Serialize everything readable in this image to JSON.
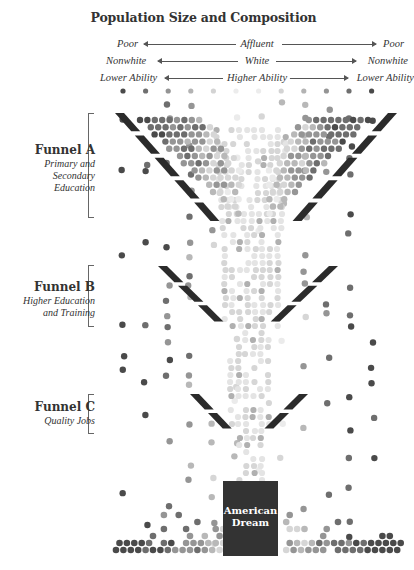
{
  "title": "Population Size and Composition",
  "axes": [
    {
      "left": "Poor",
      "center": "Affluent",
      "right": "Poor"
    },
    {
      "left": "Nonwhite",
      "center": "White",
      "right": "Nonwhite"
    },
    {
      "left": "Lower Ability",
      "center": "Higher Ability",
      "right": "Lower Ability"
    }
  ],
  "funnels": [
    {
      "name": "Funnel A",
      "description_line1": "Primary and",
      "description_line2": "Secondary",
      "description_line3": "Education"
    },
    {
      "name": "Funnel B",
      "description_line1": "Higher Education",
      "description_line2": "and Training"
    },
    {
      "name": "Funnel C",
      "description_line1": "Quality Jobs"
    }
  ],
  "destination": {
    "line1": "American",
    "line2": "Dream"
  },
  "colors": {
    "funnel_wall": "#2b2b2b",
    "cup": "#333333",
    "dot_dark": "#4a4a4a",
    "dot_mid": "#7a7a7a",
    "dot_light": "#b5b5b5",
    "dot_faint": "#e2e2e2"
  },
  "top_row_dots": [
    "dark",
    "mid",
    "mid-light",
    "light",
    "faint",
    "faintest",
    "faintest",
    "faint",
    "light",
    "mid-light",
    "mid",
    "dark"
  ]
}
